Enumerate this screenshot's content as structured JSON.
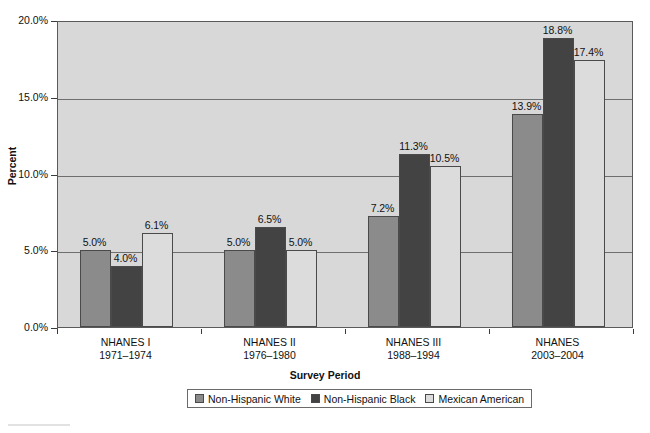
{
  "chart_data": {
    "type": "bar",
    "title": "",
    "xlabel": "Survey Period",
    "ylabel": "Percent",
    "ylim": [
      0,
      20
    ],
    "ytick_labels": [
      "0.0%",
      "5.0%",
      "10.0%",
      "15.0%",
      "20.0%"
    ],
    "ytick_values": [
      0,
      5,
      10,
      15,
      20
    ],
    "grid": true,
    "grid_axis": "y",
    "legend_position": "bottom-center",
    "categories": [
      "NHANES I",
      "NHANES II",
      "NHANES III",
      "NHANES"
    ],
    "category_sublabels": [
      "1971–1974",
      "1976–1980",
      "1988–1994",
      "2003–2004"
    ],
    "series": [
      {
        "name": "Non-Hispanic White",
        "color": "#8b8b8b",
        "values": [
          5.0,
          5.0,
          7.2,
          13.9
        ],
        "data_labels": [
          "5.0%",
          "5.0%",
          "7.2%",
          "13.9%"
        ]
      },
      {
        "name": "Non-Hispanic Black",
        "color": "#434343",
        "values": [
          4.0,
          6.5,
          11.3,
          18.8
        ],
        "data_labels": [
          "4.0%",
          "6.5%",
          "11.3%",
          "18.8%"
        ]
      },
      {
        "name": "Mexican American",
        "color": "#dcdcdc",
        "values": [
          6.1,
          5.0,
          10.5,
          17.4
        ],
        "data_labels": [
          "6.1%",
          "5.0%",
          "10.5%",
          "17.4%"
        ]
      }
    ]
  },
  "colors": {
    "plot_background": "#d8d8d8",
    "page_background": "#ffffff",
    "axis": "#5a5a5a",
    "gridline": "#6e6e6e",
    "text": "#111111"
  }
}
